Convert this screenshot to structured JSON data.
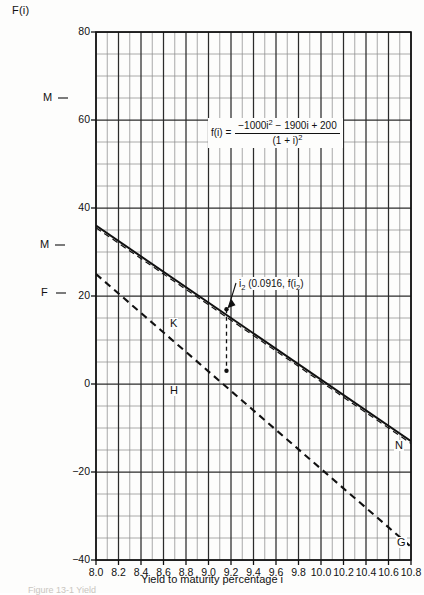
{
  "figure": {
    "ylabel_top": "F(i)",
    "xlabel_bottom": "Yield to maturity percentage i",
    "caption_partial": "Figure 13-1  Yield"
  },
  "formula": {
    "lhs": "f(i)  =",
    "numerator_a": "−1000i",
    "numerator_exp": "2",
    "numerator_b": " − 1900i + 200",
    "denominator_a": "(1 + i)",
    "denominator_exp": "2"
  },
  "annotation": {
    "prefix": "i",
    "subscript": "2",
    "text": " (0.0916, f(i",
    "subscript2": "2",
    "suffix": ")"
  },
  "point_labels": [
    {
      "id": "M-upper",
      "text": "M",
      "x": 42,
      "y": 92
    },
    {
      "id": "M-lower",
      "text": "M",
      "x": 39,
      "y": 239
    },
    {
      "id": "F-left",
      "text": "F",
      "x": 40,
      "y": 287
    },
    {
      "id": "K-point",
      "text": "K",
      "x": 169,
      "y": 318
    },
    {
      "id": "H-point",
      "text": "H",
      "x": 169,
      "y": 385
    },
    {
      "id": "N-right",
      "text": "N",
      "x": 394,
      "y": 440
    },
    {
      "id": "G-right",
      "text": "G",
      "x": 396,
      "y": 537
    }
  ],
  "chart_data": {
    "type": "line",
    "title": "",
    "xlabel": "Yield to maturity percentage i",
    "ylabel": "F(i)",
    "xlim": [
      8.0,
      10.8
    ],
    "ylim": [
      -40,
      80
    ],
    "grid": true,
    "x_major_step": 0.2,
    "x_minor_step": 0.1,
    "y_major_step": 20,
    "y_minor_step": 5,
    "xticks": [
      "8.0",
      "8.2",
      "8.4",
      "8.6",
      "8.8",
      "9.0",
      "9.2",
      "9.4",
      "9.6",
      "9.8",
      "10.0",
      "10.2",
      "10.4",
      "10.6",
      "10.8"
    ],
    "xtick_values": [
      8.0,
      8.2,
      8.4,
      8.6,
      8.8,
      9.0,
      9.2,
      9.4,
      9.6,
      9.8,
      10.0,
      10.2,
      10.4,
      10.6,
      10.8
    ],
    "yticks": [
      "80",
      "60",
      "40",
      "20",
      "0",
      "−20",
      "−40"
    ],
    "ytick_values": [
      80,
      60,
      40,
      20,
      0,
      -20,
      -40
    ],
    "legend_position": "none",
    "series": [
      {
        "name": "MN",
        "style": "solid",
        "color": "#111111",
        "x": [
          8.0,
          10.8
        ],
        "y": [
          36.0,
          -13.0
        ]
      },
      {
        "name": "FG",
        "style": "dashed",
        "color": "#111111",
        "x": [
          8.0,
          10.8
        ],
        "y": [
          25.0,
          -37.0
        ]
      }
    ],
    "markers": [
      {
        "name": "K",
        "x": 9.16,
        "y": 17.0
      },
      {
        "name": "H",
        "x": 9.16,
        "y": 3.0
      }
    ],
    "annotations": [
      {
        "name": "i2-callout",
        "x": 9.16,
        "y": 17.0,
        "text": "i2 (0.0916, f(i2)"
      }
    ],
    "dropline": {
      "x": 9.16,
      "y_from": 17.0,
      "y_to": 3.0,
      "style": "dashed"
    }
  }
}
